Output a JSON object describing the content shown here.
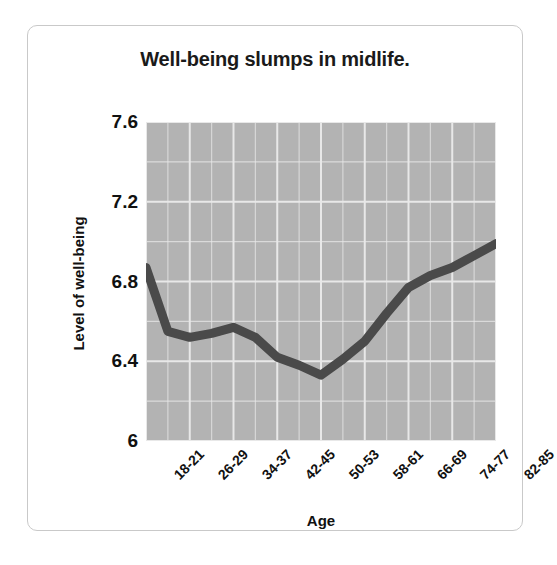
{
  "figure": {
    "title": "Well-being slumps in midlife."
  },
  "chart_data": {
    "type": "line",
    "title": "Well-being slumps in midlife.",
    "xlabel": "Age",
    "ylabel": "Level of well-being",
    "ylim": [
      6,
      7.6
    ],
    "yticks": [
      "6",
      "6.4",
      "6.8",
      "7.2",
      "7.6"
    ],
    "ytick_values": [
      6,
      6.4,
      6.8,
      7.2,
      7.6
    ],
    "grid": true,
    "legend": "none",
    "line_color": "#4a4a4a",
    "plot_background": "#b3b3b3",
    "gridline_color": "#e8e8e8",
    "categories": [
      "18-21",
      "22-25",
      "26-29",
      "30-33",
      "34-37",
      "38-41",
      "42-45",
      "46-49",
      "50-53",
      "54-57",
      "58-61",
      "62-65",
      "66-69",
      "70-73",
      "74-77",
      "78-81",
      "82-85"
    ],
    "xtick_labels": [
      "18-21",
      "26-29",
      "34-37",
      "42-45",
      "50-53",
      "58-61",
      "66-69",
      "74-77",
      "82-85"
    ],
    "values": [
      6.87,
      6.55,
      6.52,
      6.54,
      6.57,
      6.52,
      6.42,
      6.38,
      6.33,
      6.41,
      6.5,
      6.64,
      6.77,
      6.83,
      6.87,
      6.93,
      6.99
    ]
  }
}
